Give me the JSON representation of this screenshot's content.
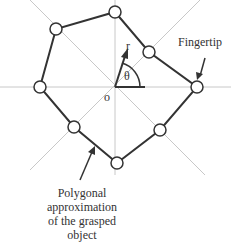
{
  "diagram": {
    "labels": {
      "origin": "o",
      "radius": "r",
      "angle": "θ",
      "fingertip": "Fingertip",
      "caption_lines": [
        "Polygonal",
        "approximation",
        "of the grasped",
        "object"
      ]
    },
    "center": [
      115,
      87
    ],
    "vertices": [
      [
        115,
        12
      ],
      [
        149,
        52
      ],
      [
        197,
        87
      ],
      [
        160,
        130
      ],
      [
        117,
        163
      ],
      [
        74,
        127
      ],
      [
        40,
        87
      ],
      [
        56,
        29
      ]
    ],
    "colors": {
      "polygon": "#333333",
      "axes": "#c8c8c8",
      "nodes_fill": "#ffffff"
    }
  }
}
